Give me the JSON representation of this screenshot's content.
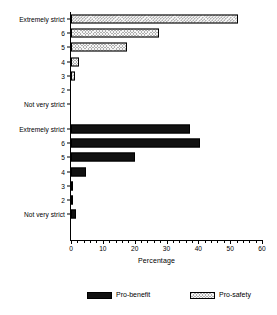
{
  "chart_data": {
    "type": "bar",
    "orientation": "horizontal",
    "title": "",
    "xlabel": "Percentage",
    "ylabel": "",
    "xlim": [
      0,
      60
    ],
    "xticks": [
      0,
      10,
      20,
      30,
      40,
      50,
      60
    ],
    "xtick_labels": [
      "0",
      "10",
      "20",
      "30",
      "40",
      "50",
      "60"
    ],
    "minor_tick_step": 2,
    "grid": false,
    "legend_position": "bottom",
    "categories": [
      "Extremely strict",
      "6",
      "5",
      "4",
      "3",
      "2",
      "Not very strict"
    ],
    "panels": [
      {
        "name": "Pro-safety",
        "fill": "hatched",
        "values": [
          52.5,
          27.5,
          17.5,
          2.5,
          1.3,
          0,
          0
        ]
      },
      {
        "name": "Pro-benefit",
        "fill": "solid-black",
        "values": [
          37.5,
          40.5,
          20.0,
          4.7,
          0.3,
          0.2,
          1.5
        ]
      }
    ],
    "series": [
      {
        "name": "Pro-safety",
        "values": [
          52.5,
          27.5,
          17.5,
          2.5,
          1.3,
          0,
          0
        ]
      },
      {
        "name": "Pro-benefit",
        "values": [
          37.5,
          40.5,
          20.0,
          4.7,
          0.3,
          0.2,
          1.5
        ]
      }
    ],
    "legend": [
      {
        "label": "Pro-benefit",
        "swatch": "solid-black",
        "color": "#111111"
      },
      {
        "label": "Pro-safety",
        "swatch": "hatched",
        "color": "#b0b0b0"
      }
    ],
    "colors": {
      "pro_benefit": "#111111",
      "pro_safety": "#b0b0b0",
      "axis": "#000000",
      "background": "#ffffff"
    }
  }
}
